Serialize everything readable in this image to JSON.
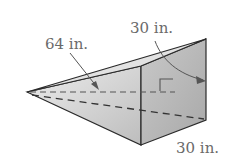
{
  "diagram": {
    "type": "triangular-pyramid-prism-solid",
    "labels": {
      "slant": "64 in.",
      "height": "30 in.",
      "base": "30 in."
    },
    "colors": {
      "edge": "#2a2a2a",
      "face_light": "#d8d8d8",
      "face_dark": "#b4b4b4",
      "label": "#6a6a6a"
    }
  }
}
